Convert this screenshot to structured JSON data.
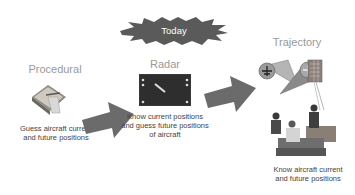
{
  "banner": {
    "label": "Today"
  },
  "stages": [
    {
      "title": "Procedural",
      "caption_lines": [
        "Guess aircraft current",
        "and future positions"
      ]
    },
    {
      "title": "Radar",
      "caption_lines": [
        "Know current positions",
        "and guess future positions",
        "of aircraft"
      ]
    },
    {
      "title": "Trajectory",
      "caption_lines": [
        "Know aircraft current",
        "and future positions"
      ]
    }
  ],
  "colors": {
    "arrow": "#6b6b6b",
    "burst": "#5a5a5a",
    "title": "#9a9a9a",
    "caption": "#444444"
  }
}
